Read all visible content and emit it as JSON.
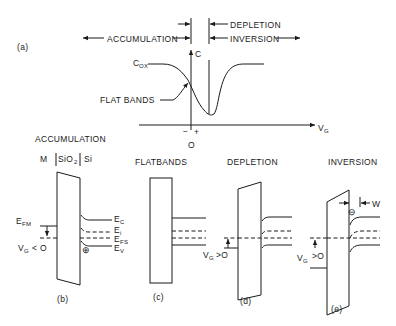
{
  "panel_a": {
    "label": "(a)",
    "region_accumulation": "ACCUMULATION",
    "region_depletion": "DEPLETION",
    "region_inversion": "INVERSION",
    "y_axis_label": "C",
    "x_axis_label": "V",
    "x_axis_sub": "G",
    "cox_label": "C",
    "cox_sub": "OX",
    "flat_bands_label": "FLAT BANDS",
    "minus_sign": "−",
    "plus_sign": "+",
    "origin_label": "O"
  },
  "panel_b": {
    "title": "ACCUMULATION",
    "layer_metal": "M",
    "layer_oxide": "SiO",
    "layer_oxide_sub": "2",
    "layer_si": "Si",
    "efm_label": "E",
    "efm_sub": "FM",
    "ec_label": "E",
    "ec_sub": "C",
    "ei_label": "E",
    "ei_sub": "i",
    "efs_label": "E",
    "efs_sub": "FS",
    "ev_label": "E",
    "ev_sub": "V",
    "vg_label": "V",
    "vg_sub": "G",
    "vg_cond": "< O",
    "hole_symbol": "⊕",
    "caption": "(b)"
  },
  "panel_c": {
    "title": "FLATBANDS",
    "caption": "(c)"
  },
  "panel_d": {
    "title": "DEPLETION",
    "vg_label": "V",
    "vg_sub": "G",
    "vg_cond": ">O",
    "caption": "(d)"
  },
  "panel_e": {
    "title": "INVERSION",
    "width_label": "W",
    "electron_symbol": "⊖",
    "vg_label": "V",
    "vg_sub": "G",
    "vg_cond": ">O",
    "caption": "(e)"
  }
}
